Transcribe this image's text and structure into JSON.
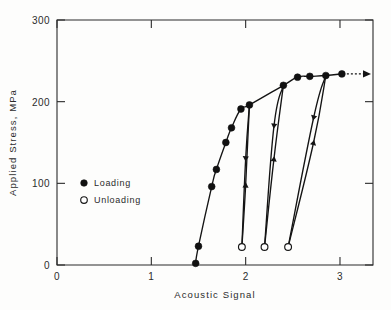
{
  "chart_data": {
    "type": "line",
    "title": "",
    "xlabel": "Acoustic Signal",
    "ylabel": "Applied Stress, MPa",
    "xlim": [
      0,
      3.35
    ],
    "ylim": [
      0,
      300
    ],
    "xticks": [
      0,
      1,
      2,
      3
    ],
    "xticklabels": [
      "0",
      "1",
      "2",
      "3"
    ],
    "yticks": [
      0,
      100,
      200,
      300
    ],
    "yticklabels": [
      "0",
      "100",
      "200",
      "300"
    ],
    "grid": false,
    "legend_position": "center-left",
    "legend": [
      {
        "label": "Loading",
        "marker": "filled-circle"
      },
      {
        "label": "Unloading",
        "marker": "open-circle"
      }
    ],
    "series": [
      {
        "name": "Loading",
        "marker": "filled-circle",
        "points": [
          {
            "x": 1.47,
            "y": 2
          },
          {
            "x": 1.5,
            "y": 23
          },
          {
            "x": 1.64,
            "y": 96
          },
          {
            "x": 1.69,
            "y": 117
          },
          {
            "x": 1.79,
            "y": 150
          },
          {
            "x": 1.85,
            "y": 168
          },
          {
            "x": 1.95,
            "y": 191
          },
          {
            "x": 2.04,
            "y": 196
          },
          {
            "x": 2.4,
            "y": 220
          },
          {
            "x": 2.55,
            "y": 230
          },
          {
            "x": 2.68,
            "y": 231
          },
          {
            "x": 2.85,
            "y": 232
          },
          {
            "x": 3.02,
            "y": 234
          }
        ]
      },
      {
        "name": "Unloading cycle 1",
        "marker": "open-circle",
        "direction": "down",
        "points": [
          {
            "x": 2.04,
            "y": 196
          },
          {
            "x": 2.0,
            "y": 130
          },
          {
            "x": 1.96,
            "y": 22
          }
        ]
      },
      {
        "name": "Reloading cycle 1",
        "marker": "none",
        "direction": "up",
        "points": [
          {
            "x": 1.96,
            "y": 22
          },
          {
            "x": 2.0,
            "y": 98
          },
          {
            "x": 2.04,
            "y": 196
          }
        ]
      },
      {
        "name": "Unloading cycle 2",
        "marker": "open-circle",
        "direction": "down",
        "points": [
          {
            "x": 2.4,
            "y": 220
          },
          {
            "x": 2.3,
            "y": 170
          },
          {
            "x": 2.2,
            "y": 22
          }
        ]
      },
      {
        "name": "Reloading cycle 2",
        "marker": "none",
        "direction": "up",
        "points": [
          {
            "x": 2.2,
            "y": 22
          },
          {
            "x": 2.3,
            "y": 130
          },
          {
            "x": 2.4,
            "y": 220
          }
        ]
      },
      {
        "name": "Unloading cycle 3",
        "marker": "open-circle",
        "direction": "down",
        "points": [
          {
            "x": 2.85,
            "y": 232
          },
          {
            "x": 2.72,
            "y": 180
          },
          {
            "x": 2.45,
            "y": 22
          }
        ]
      },
      {
        "name": "Reloading cycle 3",
        "marker": "none",
        "direction": "up",
        "points": [
          {
            "x": 2.45,
            "y": 22
          },
          {
            "x": 2.72,
            "y": 150
          },
          {
            "x": 2.85,
            "y": 232
          }
        ]
      }
    ],
    "annotations": [
      {
        "type": "arrow",
        "text": "",
        "x": 3.02,
        "y": 234,
        "direction": "right"
      }
    ]
  }
}
